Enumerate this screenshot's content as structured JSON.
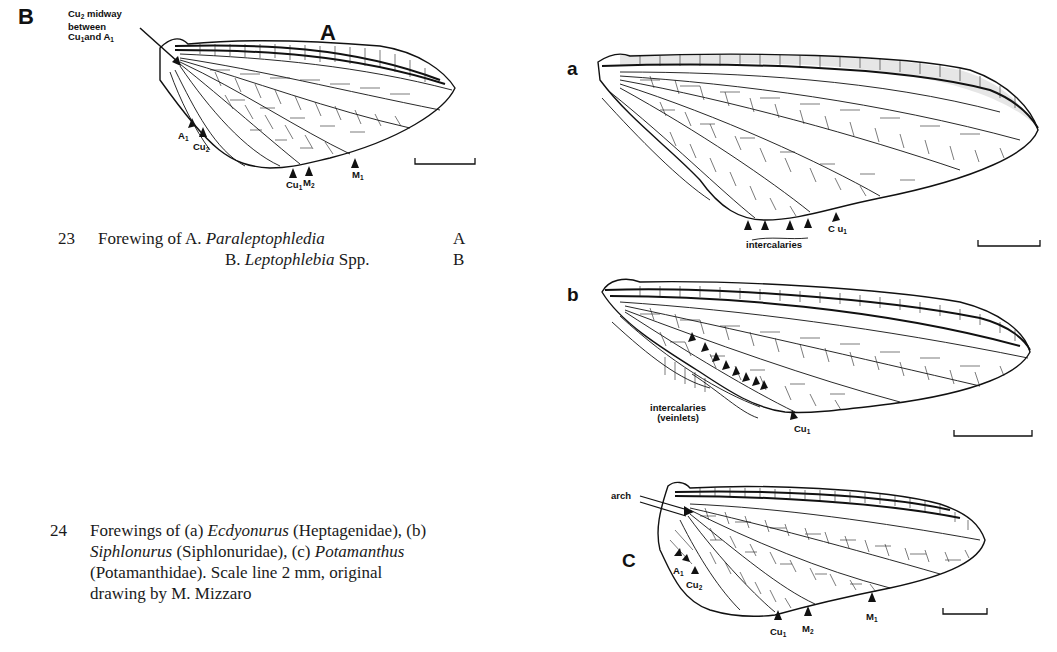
{
  "figure23": {
    "panel_labels": {
      "A": "A",
      "B": "B"
    },
    "annotation_cu2": {
      "line1_a": "Cu",
      "line1_sub": "2",
      "line1_b": " midway",
      "line2": "between",
      "line3_a": "Cu",
      "line3_sub": "1",
      "line3_b": "and A",
      "line3_sub2": "1"
    },
    "vein_labels": [
      {
        "base": "A",
        "sub": "1"
      },
      {
        "base": "Cu",
        "sub": "2"
      },
      {
        "base": "Cu",
        "sub": "1"
      },
      {
        "base": "M",
        "sub": "2"
      },
      {
        "base": "M",
        "sub": "1"
      }
    ],
    "caption": {
      "number": "23",
      "line1_prefix": "Forewing of A. ",
      "line1_taxon": "Paraleptophledia",
      "line1_key": "A",
      "line2_prefix": "B. ",
      "line2_taxon": "Leptophlebia",
      "line2_suffix": " Spp.",
      "line2_key": "B"
    }
  },
  "figure24": {
    "panel_labels": {
      "a": "a",
      "b": "b",
      "c": "C"
    },
    "wing_a": {
      "intercalaries_label": "intercalaries",
      "cu1": {
        "base": "C u",
        "sub": "1"
      }
    },
    "wing_b": {
      "intercalaries_label_line1": "intercalaries",
      "intercalaries_label_line2": "(veinlets)",
      "cu1": {
        "base": "Cu",
        "sub": "1"
      }
    },
    "wing_c": {
      "arch_label": "arch",
      "vein_labels": [
        {
          "base": "A",
          "sub": "1"
        },
        {
          "base": "Cu",
          "sub": "2"
        },
        {
          "base": "Cu",
          "sub": "1"
        },
        {
          "base": "M",
          "sub": "2"
        },
        {
          "base": "M",
          "sub": "1"
        }
      ]
    },
    "caption": {
      "number": "24",
      "l1_a": "Forewings of (a) ",
      "l1_taxon": "Ecdyonurus",
      "l1_b": " (Heptagenidae), (b)",
      "l2_taxon": "Siphlonurus",
      "l2_a": " (Siphlonuridae), (c) ",
      "l2_taxon2": "Potamanthus",
      "l3": "(Potamanthidae). Scale line 2 mm, original",
      "l4": "drawing by M. Mizzaro"
    }
  },
  "scale_bar": {
    "length_label": "2 mm"
  }
}
